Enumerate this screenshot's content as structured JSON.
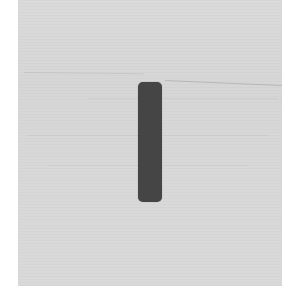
{
  "scene": {
    "description": "Gray textured surface with a single dark vertical rounded bar",
    "colors": {
      "margin": "#ffffff",
      "surface": "#d9d9d9",
      "bar": "#454545"
    },
    "elements": [
      {
        "name": "surface-panel",
        "bounds": [
          18,
          0,
          282,
          286
        ]
      },
      {
        "name": "dark-vertical-bar",
        "bounds": [
          138,
          82,
          162,
          202
        ]
      },
      {
        "name": "faint-horizontal-line",
        "from": [
          165,
          81
        ],
        "to": [
          281,
          86
        ]
      }
    ]
  }
}
